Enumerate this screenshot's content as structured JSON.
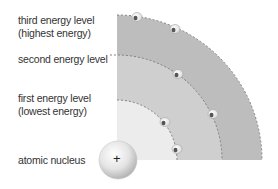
{
  "diagram": {
    "labels": {
      "third_line1": "third energy level",
      "third_line2": "(highest energy)",
      "second": "second energy level",
      "first_line1": "first energy level",
      "first_line2": "(lowest energy)",
      "nucleus": "atomic nucleus",
      "nucleus_sign": "+",
      "electron_symbol": "e"
    },
    "colors": {
      "outer_shell": "#bdbdbd",
      "middle_shell": "#cfcfcf",
      "inner_shell": "#ececec",
      "dashed_ring": "#777777",
      "text": "#333333"
    }
  }
}
